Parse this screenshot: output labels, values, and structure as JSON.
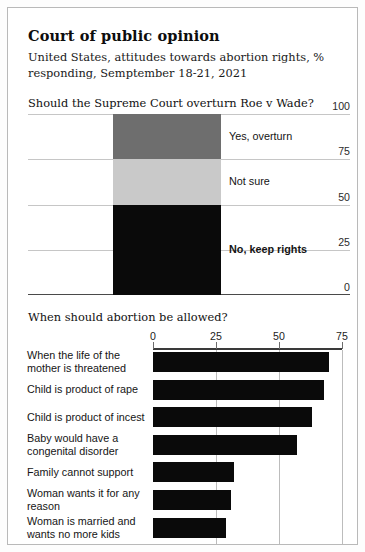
{
  "header": {
    "title": "Court of public opinion",
    "subtitle": "United States, attitudes towards abortion rights, % responding, Semptember 18-21, 2021"
  },
  "colors": {
    "dark_gray": "#6e6e6e",
    "light_gray": "#c9c9c9",
    "black": "#0a0a0a",
    "grid": "#c6c6c6",
    "axis": "#3a3a3a"
  },
  "chart_data": [
    {
      "type": "bar",
      "orientation": "vertical",
      "stacked": true,
      "title": "Should the Supreme Court overturn Roe v Wade?",
      "xlabel": "",
      "ylabel": "",
      "ylim": [
        0,
        100
      ],
      "yticks": [
        100,
        75,
        50,
        25,
        0
      ],
      "grid": true,
      "legend_position": "inline-right",
      "categories": [
        "All respondents"
      ],
      "series": [
        {
          "name": "No, keep rights",
          "values": [
            50
          ],
          "color": "#0a0a0a",
          "label_bold": true
        },
        {
          "name": "Not sure",
          "values": [
            25
          ],
          "color": "#c9c9c9",
          "label_bold": false
        },
        {
          "name": "Yes, overturn",
          "values": [
            25
          ],
          "color": "#6e6e6e",
          "label_bold": false
        }
      ]
    },
    {
      "type": "bar",
      "orientation": "horizontal",
      "title": "When should abortion be allowed?",
      "xlabel": "",
      "ylabel": "",
      "xlim": [
        0,
        75
      ],
      "xticks": [
        0,
        25,
        50,
        75
      ],
      "grid": true,
      "bar_color": "#0a0a0a",
      "categories": [
        "When the life of the mother is threatened",
        "Child is product of rape",
        "Child is product of incest",
        "Baby would have a congenital disorder",
        "Family cannot support",
        "Woman wants it for any reason",
        "Woman is married and wants no more kids"
      ],
      "values": [
        70,
        68,
        63,
        57,
        32,
        31,
        29
      ]
    }
  ]
}
